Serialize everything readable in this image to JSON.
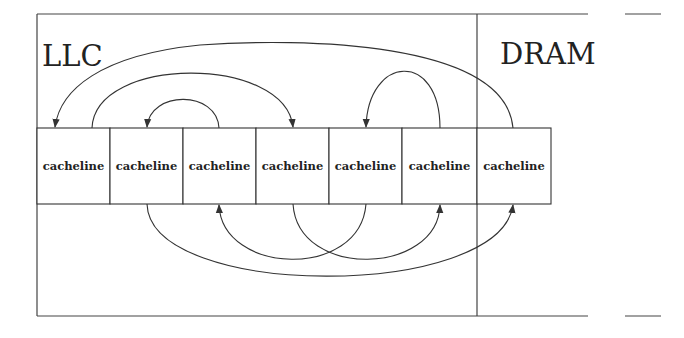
{
  "diagram": {
    "regions": [
      {
        "id": "llc",
        "label": "LLC"
      },
      {
        "id": "dram",
        "label": "DRAM"
      }
    ],
    "cachelines": [
      {
        "index": 0,
        "label": "cacheline",
        "region": "llc"
      },
      {
        "index": 1,
        "label": "cacheline",
        "region": "llc"
      },
      {
        "index": 2,
        "label": "cacheline",
        "region": "llc"
      },
      {
        "index": 3,
        "label": "cacheline",
        "region": "llc"
      },
      {
        "index": 4,
        "label": "cacheline",
        "region": "llc"
      },
      {
        "index": 5,
        "label": "cacheline",
        "region": "llc"
      },
      {
        "index": 6,
        "label": "cacheline",
        "region": "dram"
      }
    ],
    "arrows_above": [
      {
        "from": 6,
        "to": 0
      },
      {
        "from": 1,
        "to": 3
      },
      {
        "from": 2,
        "to": 1
      },
      {
        "from": 5,
        "to": 4
      }
    ],
    "arrows_below": [
      {
        "from": 1,
        "to": 6
      },
      {
        "from": 4,
        "to": 2
      },
      {
        "from": 3,
        "to": 5
      }
    ],
    "colors": {
      "stroke": "#333333",
      "background": "#ffffff"
    }
  }
}
